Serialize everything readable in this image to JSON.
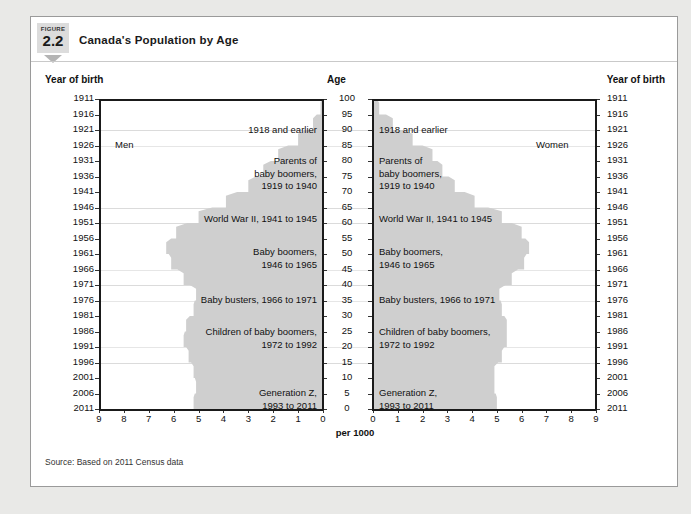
{
  "figure": {
    "label_word": "FIGURE",
    "number": "2.2",
    "title": "Canada's Population by Age"
  },
  "axes": {
    "left_axis_title": "Year of birth",
    "right_axis_title": "Year of birth",
    "center_axis_title": "Age",
    "x_axis_title": "per 1000",
    "year_ticks": [
      "1911",
      "1916",
      "1921",
      "1926",
      "1931",
      "1936",
      "1941",
      "1946",
      "1951",
      "1956",
      "1961",
      "1966",
      "1971",
      "1976",
      "1981",
      "1986",
      "1991",
      "1996",
      "2001",
      "2006",
      "2011"
    ],
    "age_ticks": [
      "100",
      "95",
      "90",
      "85",
      "80",
      "75",
      "70",
      "65",
      "60",
      "55",
      "50",
      "45",
      "40",
      "35",
      "30",
      "25",
      "20",
      "15",
      "10",
      "5",
      "0"
    ],
    "x_ticks_left": [
      "9",
      "8",
      "7",
      "6",
      "5",
      "4",
      "3",
      "2",
      "1",
      "0"
    ],
    "x_ticks_right": [
      "0",
      "1",
      "2",
      "3",
      "4",
      "5",
      "6",
      "7",
      "8",
      "9"
    ]
  },
  "panels": {
    "men_label": "Men",
    "women_label": "Women"
  },
  "annotations": [
    {
      "id": "a1918",
      "text": "1918 and earlier"
    },
    {
      "id": "parents",
      "text": "Parents of\nbaby boomers,\n1919 to 1940"
    },
    {
      "id": "wwii",
      "text": "World War II, 1941 to 1945"
    },
    {
      "id": "boomers",
      "text": "Baby boomers,\n1946 to 1965"
    },
    {
      "id": "busters",
      "text": "Baby busters, 1966 to 1971"
    },
    {
      "id": "children",
      "text": "Children of baby boomers,\n1972 to 1992"
    },
    {
      "id": "genz",
      "text": "Generation Z,\n1993 to 2011"
    }
  ],
  "source": "Source: Based on 2011 Census data",
  "colors": {
    "pyramid_fill": "#cfcfcf",
    "badge_bg": "#dcdcdc",
    "arrow": "#b4b4b4",
    "gridline": "#dbdbdb",
    "axis": "#1a1a1a",
    "text": "#111111",
    "card_bg": "#ffffff",
    "page_bg": "#e9e9e7"
  },
  "chart_data": {
    "type": "bar",
    "orientation": "horizontal",
    "subtype": "population-pyramid",
    "title": "Canada's Population by Age",
    "xlabel": "per 1000",
    "ylabel": "Age",
    "ylabel_secondary": "Year of birth",
    "xlim": [
      0,
      9
    ],
    "ylim": [
      0,
      100
    ],
    "grid": true,
    "legend": "none",
    "axis_direction": "left panel reversed (9 at far left, 0 at centre); right panel normal (0 at centre, 9 at far right)",
    "categories": [
      "0-4",
      "5-9",
      "10-14",
      "15-19",
      "20-24",
      "25-29",
      "30-34",
      "35-39",
      "40-44",
      "45-49",
      "50-54",
      "55-59",
      "60-64",
      "65-69",
      "70-74",
      "75-79",
      "80-84",
      "85-89",
      "90-94",
      "95-99",
      "100+"
    ],
    "birth_cohorts": [
      "2007-2011",
      "2002-2006",
      "1997-2001",
      "1992-1996",
      "1987-1991",
      "1982-1986",
      "1977-1981",
      "1972-1976",
      "1967-1971",
      "1962-1966",
      "1957-1961",
      "1952-1956",
      "1947-1951",
      "1942-1946",
      "1937-1941",
      "1932-1936",
      "1927-1931",
      "1922-1926",
      "1917-1921",
      "1912-1916",
      "1911 and earlier"
    ],
    "series": [
      {
        "name": "Men",
        "values": [
          5.2,
          5.1,
          5.2,
          5.4,
          5.6,
          5.5,
          5.2,
          5.1,
          5.6,
          6.1,
          6.3,
          5.9,
          5.0,
          3.9,
          3.0,
          2.4,
          1.8,
          1.0,
          0.4,
          0.1,
          0.02
        ]
      },
      {
        "name": "Women",
        "values": [
          5.0,
          4.9,
          4.9,
          5.2,
          5.4,
          5.4,
          5.2,
          5.1,
          5.6,
          6.1,
          6.3,
          6.0,
          5.2,
          4.1,
          3.3,
          2.8,
          2.4,
          1.6,
          0.8,
          0.25,
          0.05
        ]
      }
    ],
    "annotations": [
      {
        "label": "1918 and earlier",
        "age_range": [
          94,
          100
        ]
      },
      {
        "label": "Parents of baby boomers, 1919 to 1940",
        "age_range": [
          71,
          92
        ]
      },
      {
        "label": "World War II, 1941 to 1945",
        "age_range": [
          66,
          70
        ]
      },
      {
        "label": "Baby boomers, 1946 to 1965",
        "age_range": [
          46,
          65
        ]
      },
      {
        "label": "Baby busters, 1966 to 1971",
        "age_range": [
          40,
          45
        ]
      },
      {
        "label": "Children of baby boomers, 1972 to 1992",
        "age_range": [
          19,
          39
        ]
      },
      {
        "label": "Generation Z, 1993 to 2011",
        "age_range": [
          0,
          18
        ]
      }
    ]
  }
}
